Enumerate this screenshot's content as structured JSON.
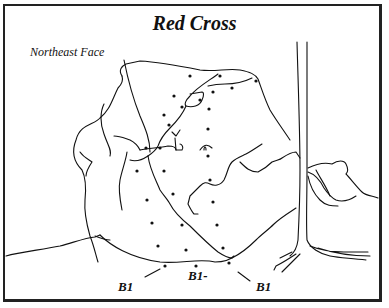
{
  "diagram": {
    "title": "Red Cross",
    "subtitle": "Northeast Face",
    "route_labels": [
      {
        "text": "B1",
        "x": 118,
        "y": 281
      },
      {
        "text": "B1-",
        "x": 188,
        "y": 270
      },
      {
        "text": "B1",
        "x": 256,
        "y": 281
      }
    ],
    "colors": {
      "line": "#111111",
      "border": "#222222",
      "background": "#ffffff"
    }
  }
}
